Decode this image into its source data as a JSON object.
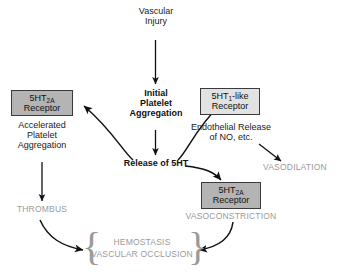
{
  "diagram": {
    "colors": {
      "text_dark": "#1a1a1a",
      "text_gray": "#9a9a9a",
      "box_dark_fill": "#b4b4b4",
      "box_light_fill": "#e2e2e2",
      "box_border": "#3a3a3a",
      "arrow": "#111111",
      "background": "#ffffff"
    },
    "nodes": {
      "vascular_injury": "Vascular\nInjury",
      "initial_platelet_aggregation": "Initial\nPlatelet\nAggregation",
      "release_of_5ht": "Release of 5HT",
      "accelerated_platelet_aggregation": "Accelerated\nPlatelet\nAggregation",
      "endothelial_release": "Endothelial Release\nof NO, etc.",
      "thrombus": "THROMBUS",
      "vasodilation": "VASODILATION",
      "vasoconstriction": "VASOCONSTRICTION",
      "hemostasis": "HEMOSTASIS",
      "vascular_occlusion": "VASCULAR OCCLUSION"
    },
    "receptor_boxes": {
      "left": {
        "prefix": "5HT",
        "subscript": "2A",
        "suffix": "",
        "line2": "Receptor",
        "fill": "dark"
      },
      "right": {
        "prefix": "5HT",
        "subscript": "1",
        "suffix": "-like",
        "line2": "Receptor",
        "fill": "light"
      },
      "bottom": {
        "prefix": "5HT",
        "subscript": "2A",
        "suffix": "",
        "line2": "Receptor",
        "fill": "dark"
      }
    },
    "braces": {
      "left": "{",
      "right": "}"
    }
  }
}
